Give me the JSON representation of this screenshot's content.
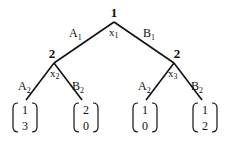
{
  "colors": {
    "ink": "#111111",
    "background": "#ffffff"
  },
  "root": {
    "player": "1",
    "node_label": "x",
    "node_sub": "1",
    "actions": [
      {
        "label": "A",
        "sub": "1"
      },
      {
        "label": "B",
        "sub": "1"
      }
    ]
  },
  "left_node": {
    "player": "2",
    "node_label": "x",
    "node_sub": "2",
    "actions": [
      {
        "label": "A",
        "sub": "2"
      },
      {
        "label": "B",
        "sub": "2"
      }
    ]
  },
  "right_node": {
    "player": "2",
    "node_label": "x",
    "node_sub": "3",
    "actions": [
      {
        "label": "A",
        "sub": "2"
      },
      {
        "label": "B",
        "sub": "2"
      }
    ]
  },
  "payoffs": [
    {
      "p1": "1",
      "p2": "3"
    },
    {
      "p1": "2",
      "p2": "0"
    },
    {
      "p1": "1",
      "p2": "0"
    },
    {
      "p1": "1",
      "p2": "2"
    }
  ]
}
